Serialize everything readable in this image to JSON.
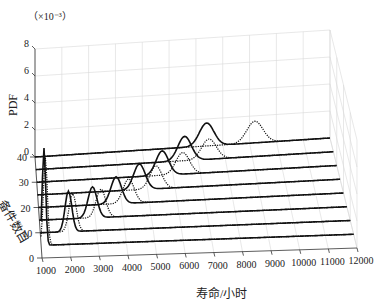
{
  "chart_data": {
    "type": "line",
    "subtype": "3d-waterfall",
    "title": "",
    "xlabel": "寿命/小时",
    "ylabel": "备件数目",
    "zlabel": "PDF",
    "z_multiplier": "（×10⁻³）",
    "xlim": [
      1000,
      12000
    ],
    "ylim": [
      0,
      40
    ],
    "zlim": [
      0,
      8
    ],
    "x_ticks": [
      "1000",
      "2000",
      "3000",
      "4000",
      "5000",
      "6000",
      "7000",
      "8000",
      "9000",
      "10000",
      "11000",
      "12000"
    ],
    "y_ticks": [
      "0",
      "10",
      "20",
      "30",
      "40"
    ],
    "z_ticks": [
      "0",
      "2",
      "4",
      "6",
      "8"
    ],
    "grid": true,
    "series": [
      {
        "name": "solid",
        "style": "solid",
        "y": 5,
        "mean": 1100,
        "peak": 7.2,
        "width": 60
      },
      {
        "name": "solid",
        "style": "solid",
        "y": 10,
        "mean": 2000,
        "peak": 3.0,
        "width": 120
      },
      {
        "name": "solid",
        "style": "solid",
        "y": 15,
        "mean": 2900,
        "peak": 2.3,
        "width": 160
      },
      {
        "name": "solid",
        "style": "solid",
        "y": 20,
        "mean": 3800,
        "peak": 2.0,
        "width": 190
      },
      {
        "name": "solid",
        "style": "solid",
        "y": 25,
        "mean": 4700,
        "peak": 1.9,
        "width": 210
      },
      {
        "name": "solid",
        "style": "solid",
        "y": 30,
        "mean": 5600,
        "peak": 1.8,
        "width": 230
      },
      {
        "name": "solid",
        "style": "solid",
        "y": 35,
        "mean": 6500,
        "peak": 1.8,
        "width": 250
      },
      {
        "name": "solid",
        "style": "solid",
        "y": 40,
        "mean": 7400,
        "peak": 1.7,
        "width": 270
      },
      {
        "name": "dotted",
        "style": "dotted",
        "y": 5,
        "mean": 1150,
        "peak": 6.5,
        "width": 70
      },
      {
        "name": "dotted",
        "style": "dotted",
        "y": 10,
        "mean": 2150,
        "peak": 2.8,
        "width": 130
      },
      {
        "name": "dotted",
        "style": "dotted",
        "y": 15,
        "mean": 3200,
        "peak": 2.1,
        "width": 170
      },
      {
        "name": "dotted",
        "style": "dotted",
        "y": 20,
        "mean": 4250,
        "peak": 1.8,
        "width": 200
      },
      {
        "name": "dotted",
        "style": "dotted",
        "y": 25,
        "mean": 5300,
        "peak": 1.7,
        "width": 220
      },
      {
        "name": "dotted",
        "style": "dotted",
        "y": 30,
        "mean": 6350,
        "peak": 1.6,
        "width": 250
      },
      {
        "name": "dotted",
        "style": "dotted",
        "y": 35,
        "mean": 7400,
        "peak": 1.5,
        "width": 270
      },
      {
        "name": "dotted",
        "style": "dotted",
        "y": 40,
        "mean": 9200,
        "peak": 1.6,
        "width": 300
      }
    ]
  },
  "labels": {
    "multiplier": "（×10⁻³）",
    "zlabel": "PDF",
    "ylabel": "备件数目",
    "xlabel": "寿命/小时"
  }
}
